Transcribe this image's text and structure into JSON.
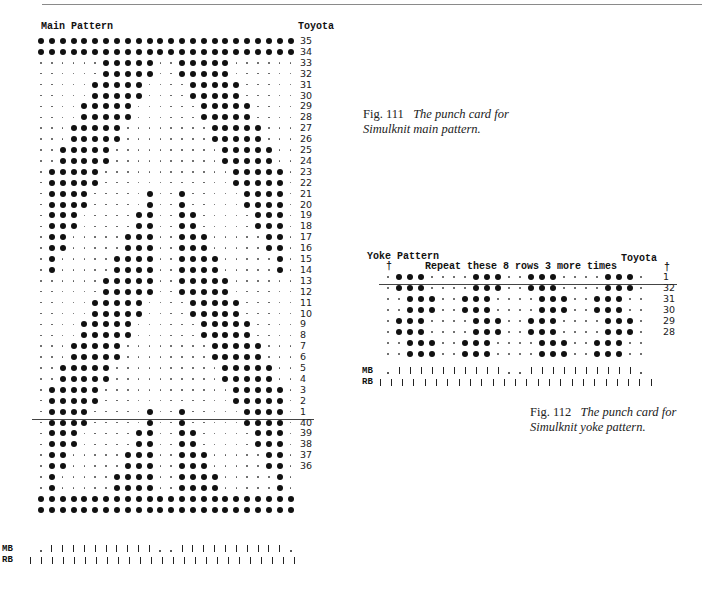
{
  "main_card": {
    "title": "Main Pattern",
    "machine": "Toyota",
    "columns": 24,
    "rows": [
      {
        "label": "35",
        "pattern": "########################"
      },
      {
        "label": "34",
        "pattern": "########################"
      },
      {
        "label": "33",
        "pattern": "......#####..#####......"
      },
      {
        "label": "32",
        "pattern": "......#####..#####......"
      },
      {
        "label": "31",
        "pattern": ".....#####....#####....."
      },
      {
        "label": "30",
        "pattern": ".....#####....#####....."
      },
      {
        "label": "29",
        "pattern": "....#####......#####...."
      },
      {
        "label": "28",
        "pattern": "....#####......#####...."
      },
      {
        "label": "27",
        "pattern": "...#####........#####..."
      },
      {
        "label": "26",
        "pattern": "...#####........#####..."
      },
      {
        "label": "25",
        "pattern": "..#####..........#####.."
      },
      {
        "label": "24",
        "pattern": "..#####..........#####.."
      },
      {
        "label": "23",
        "pattern": ".#####............#####."
      },
      {
        "label": "22",
        "pattern": ".#####............#####."
      },
      {
        "label": "21",
        "pattern": ".####.....#..#.....####."
      },
      {
        "label": "20",
        "pattern": ".####.....#..#.....####."
      },
      {
        "label": "19",
        "pattern": ".###.....##..##.....###."
      },
      {
        "label": "18",
        "pattern": ".###.....##..##.....###."
      },
      {
        "label": "17",
        "pattern": ".##.....###..###.....##."
      },
      {
        "label": "16",
        "pattern": ".##.....###..###.....##."
      },
      {
        "label": "15",
        "pattern": ".#.....####..####.....#."
      },
      {
        "label": "14",
        "pattern": ".#.....####..####.....#."
      },
      {
        "label": "13",
        "pattern": "......#####..#####......"
      },
      {
        "label": "12",
        "pattern": "......#####..#####......"
      },
      {
        "label": "11",
        "pattern": ".....#####....#####....."
      },
      {
        "label": "10",
        "pattern": ".....#####....#####....."
      },
      {
        "label": "9",
        "pattern": "....#####......#####...."
      },
      {
        "label": "8",
        "pattern": "....#####......#####...."
      },
      {
        "label": "7",
        "pattern": "...#####........#####..."
      },
      {
        "label": "6",
        "pattern": "...#####........#####..."
      },
      {
        "label": "5",
        "pattern": "..#####..........#####.."
      },
      {
        "label": "4",
        "pattern": "..#####..........#####.."
      },
      {
        "label": "3",
        "pattern": ".#####............#####."
      },
      {
        "label": "2",
        "pattern": ".#####............#####."
      },
      {
        "label": "1",
        "pattern": ".####.....#..#.....####.",
        "underline": true
      },
      {
        "label": "40",
        "pattern": ".####.....#..#.....####."
      },
      {
        "label": "39",
        "pattern": ".###.....##..##.....###."
      },
      {
        "label": "38",
        "pattern": ".###.....##..##.....###."
      },
      {
        "label": "37",
        "pattern": ".##.....###..###.....##."
      },
      {
        "label": "36",
        "pattern": ".##.....###..###.....##."
      },
      {
        "label": "",
        "pattern": ".#.....####..####.....#."
      },
      {
        "label": "",
        "pattern": ".#.....####..####.....#."
      },
      {
        "label": "",
        "pattern": "########################"
      },
      {
        "label": "",
        "pattern": "########################"
      }
    ],
    "mb_label": "MB",
    "mb_pattern": ".||||||||||..||||||||||.",
    "rb_label": "RB",
    "rb_pattern": "|||||||||||||||||||||||||"
  },
  "main_caption": {
    "fig": "Fig. 111",
    "line1": "The punch card for",
    "line2": "Simulknit main pattern."
  },
  "yoke_card": {
    "title": "Yoke Pattern",
    "machine": "Toyota",
    "arrow_left": "†",
    "arrow_right": "†",
    "repeat_note": "Repeat these 8 rows 3 more times",
    "columns": 24,
    "rows": [
      {
        "label": "1",
        "pattern": ".###....###..###....###.",
        "underline": true
      },
      {
        "label": "32",
        "pattern": ".###....###..###....###."
      },
      {
        "label": "31",
        "pattern": "..###..###....###..###.."
      },
      {
        "label": "30",
        "pattern": "..###..###....###..###.."
      },
      {
        "label": "29",
        "pattern": ".###....###..###....###."
      },
      {
        "label": "28",
        "pattern": ".###....###..###....###."
      },
      {
        "label": "",
        "pattern": "..###..###....###..###.."
      },
      {
        "label": "",
        "pattern": "..###..###....###..###.."
      }
    ],
    "mb_label": "MB",
    "mb_pattern": ".||||||||||..||||||||||.",
    "rb_label": "RB",
    "rb_pattern": "|||||||||||||||||||||||||"
  },
  "yoke_caption": {
    "fig": "Fig. 112",
    "line1": "The punch card for",
    "line2": "Simulknit yoke pattern."
  }
}
